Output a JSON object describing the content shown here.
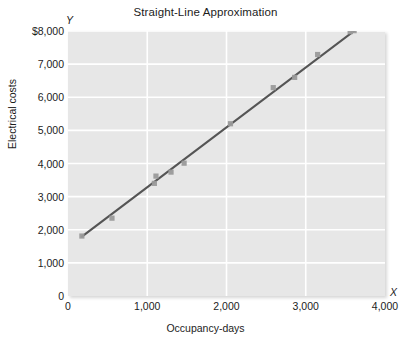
{
  "chart_data": {
    "type": "scatter",
    "title": "Straight-Line Approximation",
    "xlabel": "Occupancy-days",
    "ylabel": "Electrical costs",
    "xlim": [
      0,
      4000
    ],
    "ylim": [
      0,
      8000
    ],
    "grid": true,
    "legend": null,
    "x_axis_marker": "X",
    "y_axis_marker": "Y",
    "x_ticks": [
      {
        "value": 0,
        "label": "0"
      },
      {
        "value": 1000,
        "label": "1,000"
      },
      {
        "value": 2000,
        "label": "2,000"
      },
      {
        "value": 3000,
        "label": "3,000"
      },
      {
        "value": 4000,
        "label": "4,000"
      }
    ],
    "y_ticks": [
      {
        "value": 8000,
        "label": "$8,000"
      },
      {
        "value": 7000,
        "label": "7,000"
      },
      {
        "value": 6000,
        "label": "6,000"
      },
      {
        "value": 5000,
        "label": "5,000"
      },
      {
        "value": 4000,
        "label": "4,000"
      },
      {
        "value": 3000,
        "label": "3,000"
      },
      {
        "value": 2000,
        "label": "2,000"
      },
      {
        "value": 1000,
        "label": "1,000"
      },
      {
        "value": 0,
        "label": "0"
      }
    ],
    "points": [
      {
        "x": 175,
        "y": 1810
      },
      {
        "x": 555,
        "y": 2350
      },
      {
        "x": 1090,
        "y": 3400
      },
      {
        "x": 1110,
        "y": 3620
      },
      {
        "x": 1300,
        "y": 3740
      },
      {
        "x": 1465,
        "y": 4010
      },
      {
        "x": 2050,
        "y": 5200
      },
      {
        "x": 2590,
        "y": 6290
      },
      {
        "x": 2860,
        "y": 6600
      },
      {
        "x": 3150,
        "y": 7290
      },
      {
        "x": 3560,
        "y": 7980
      },
      {
        "x": 3610,
        "y": 8010
      }
    ],
    "trendline": {
      "name": "Straight-line approximation",
      "x0": 175,
      "y0": 1790,
      "x1": 3615,
      "y1": 8010
    },
    "colors": {
      "plot_background": "#e7e7e7",
      "gridline": "#ffffff",
      "point": "#9a9a9a",
      "trendline": "#555555",
      "text": "#1c1c1c"
    }
  }
}
